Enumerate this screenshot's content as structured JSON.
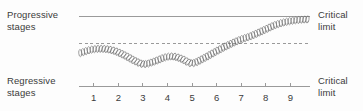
{
  "labels": {
    "progressive": "Progressive\nstages",
    "regressive": "Regressive\nstages",
    "critical_top": "Critical\nlimit",
    "critical_bottom": "Critical\nlimit"
  },
  "colors": {
    "text": "#3b3b3b",
    "line": "#9a9a9a",
    "curve": "#6b6b6b",
    "background": "#fdfdfd"
  },
  "chart_data": {
    "type": "line",
    "title": "",
    "xlabel": "",
    "ylabel": "",
    "grid": false,
    "legend": "none",
    "x_ticks": [
      1,
      2,
      3,
      4,
      5,
      6,
      7,
      8,
      9
    ],
    "xlim": [
      0.4,
      9.8
    ],
    "ylim": [
      0,
      10
    ],
    "annotations": [
      {
        "name": "upper-critical-limit",
        "type": "hline",
        "y": 8.2,
        "style": "solid",
        "label": "Critical limit"
      },
      {
        "name": "lower-critical-limit",
        "type": "hline",
        "y": 0.0,
        "style": "solid",
        "label": "Critical limit"
      },
      {
        "name": "threshold",
        "type": "hline",
        "y": 5.0,
        "style": "dashed",
        "label": ""
      }
    ],
    "series": [
      {
        "name": "coiled-trajectory",
        "style": "coiled",
        "x": [
          0.45,
          0.9,
          1.35,
          1.8,
          2.25,
          2.7,
          3.05,
          3.45,
          3.9,
          4.25,
          4.6,
          5.0,
          5.45,
          5.95,
          6.45,
          6.95,
          7.4,
          7.9,
          8.4,
          8.9,
          9.4,
          9.75
        ],
        "y": [
          3.55,
          3.95,
          4.05,
          3.85,
          3.3,
          2.6,
          2.25,
          2.55,
          3.05,
          3.15,
          2.85,
          2.35,
          2.9,
          3.7,
          4.45,
          5.1,
          5.55,
          6.2,
          6.85,
          7.25,
          7.45,
          7.5
        ]
      }
    ]
  }
}
